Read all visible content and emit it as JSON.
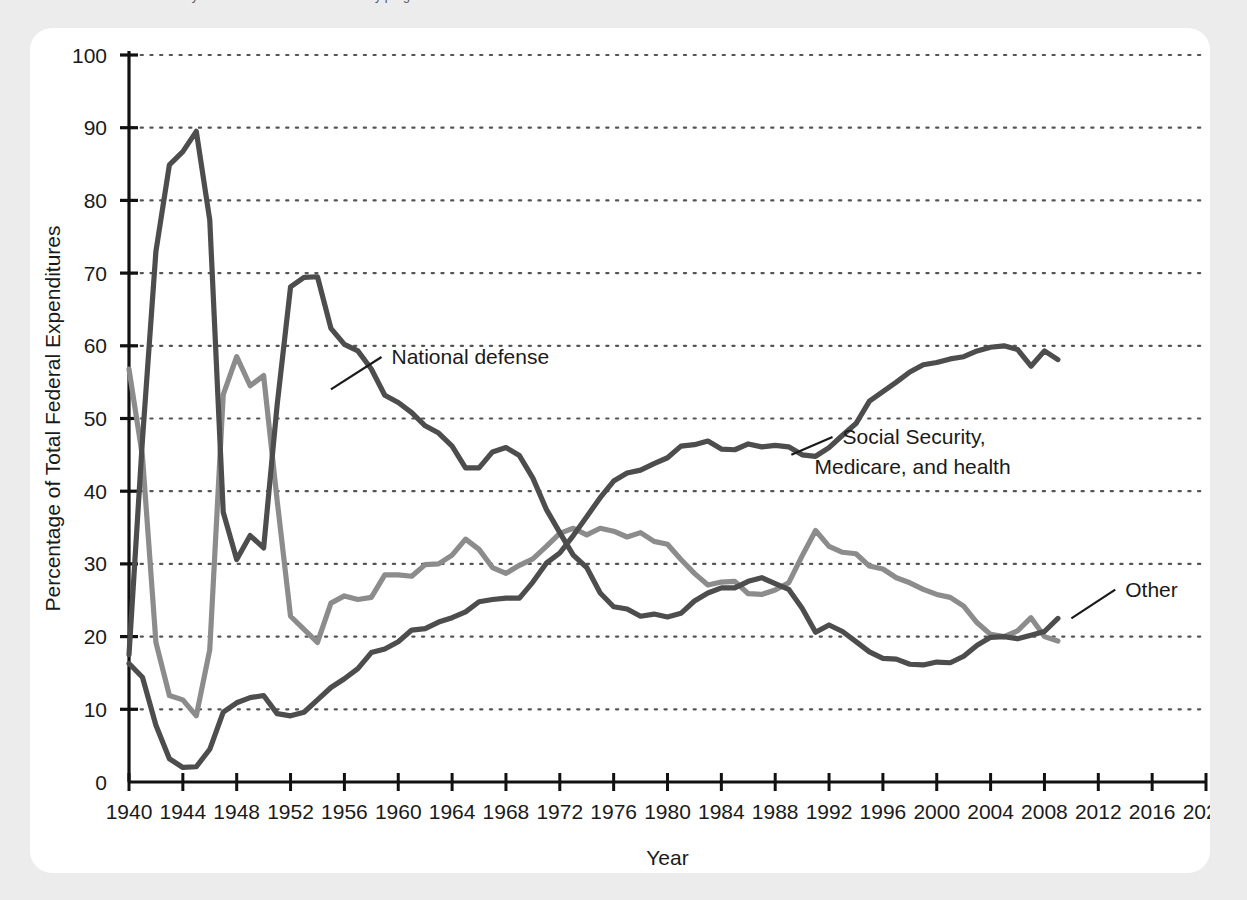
{
  "caption": {
    "text": "mes the mid-1950s. Social Security and other transfers to the elderly programs"
  },
  "chart_data": {
    "type": "line",
    "title": "",
    "xlabel": "Year",
    "ylabel": "Percentage of Total Federal Expenditures",
    "xlim": [
      1940,
      2020
    ],
    "ylim": [
      0,
      100
    ],
    "xticks": [
      1940,
      1944,
      1948,
      1952,
      1956,
      1960,
      1964,
      1968,
      1972,
      1976,
      1980,
      1984,
      1988,
      1992,
      1996,
      2000,
      2004,
      2008,
      2012,
      2016,
      2020
    ],
    "yticks": [
      0,
      10,
      20,
      30,
      40,
      50,
      60,
      70,
      80,
      90,
      100
    ],
    "grid": "horizontal-dotted",
    "legend": "inline-annotations",
    "colors": {
      "national_defense": "#4d4d4d",
      "social_security": "#4d4d4d",
      "other": "#8c8c8c",
      "grid": "#555555",
      "axis": "#111111",
      "background": "#ffffff",
      "page": "#ececec"
    },
    "annotations": [
      {
        "name": "national-defense",
        "label": "National defense",
        "label_x": 1959.5,
        "label_y": 57.5,
        "anchor_x": 1955.0,
        "anchor_y": 54.0
      },
      {
        "name": "social-security",
        "label": "Social Security,",
        "label2": "Medicare, and health",
        "label_x": 1993.0,
        "label_y": 46.5,
        "anchor_x": 1989.2,
        "anchor_y": 45.0
      },
      {
        "name": "other",
        "label": "Other",
        "label_x": 2014.0,
        "label_y": 25.5,
        "anchor_x": 2010.0,
        "anchor_y": 22.5
      }
    ],
    "series": [
      {
        "name": "National defense",
        "color": "#4d4d4d",
        "x": [
          1940,
          1941,
          1942,
          1943,
          1944,
          1945,
          1946,
          1947,
          1948,
          1949,
          1950,
          1951,
          1952,
          1953,
          1954,
          1955,
          1956,
          1957,
          1958,
          1959,
          1960,
          1961,
          1962,
          1963,
          1964,
          1965,
          1966,
          1967,
          1968,
          1969,
          1970,
          1971,
          1972,
          1973,
          1974,
          1975,
          1976,
          1977,
          1978,
          1979,
          1980,
          1981,
          1982,
          1983,
          1984,
          1985,
          1986,
          1987,
          1988,
          1989,
          1990,
          1991,
          1992,
          1993,
          1994,
          1995,
          1996,
          1997,
          1998,
          1999,
          2000,
          2001,
          2002,
          2003,
          2004,
          2005,
          2006,
          2007,
          2008,
          2009
        ],
        "values": [
          17.5,
          47.1,
          73.0,
          84.9,
          86.7,
          89.5,
          77.3,
          37.1,
          30.6,
          33.9,
          32.2,
          51.8,
          68.1,
          69.4,
          69.5,
          62.4,
          60.2,
          59.3,
          56.8,
          53.2,
          52.2,
          50.8,
          49.0,
          48.0,
          46.2,
          43.2,
          43.2,
          45.4,
          46.0,
          44.9,
          41.8,
          37.5,
          34.3,
          31.2,
          29.5,
          26.0,
          24.1,
          23.8,
          22.8,
          23.1,
          22.7,
          23.2,
          24.9,
          26.0,
          26.7,
          26.7,
          27.6,
          28.1,
          27.3,
          26.5,
          23.9,
          20.6,
          21.6,
          20.7,
          19.3,
          17.9,
          17.0,
          16.9,
          16.2,
          16.1,
          16.5,
          16.4,
          17.3,
          18.8,
          19.9,
          20.0,
          19.7,
          20.2,
          20.7,
          22.5
        ]
      },
      {
        "name": "Social Security, Medicare, and health",
        "color": "#4d4d4d",
        "x": [
          1940,
          1941,
          1942,
          1943,
          1944,
          1945,
          1946,
          1947,
          1948,
          1949,
          1950,
          1951,
          1952,
          1953,
          1954,
          1955,
          1956,
          1957,
          1958,
          1959,
          1960,
          1961,
          1962,
          1963,
          1964,
          1965,
          1966,
          1967,
          1968,
          1969,
          1970,
          1971,
          1972,
          1973,
          1974,
          1975,
          1976,
          1977,
          1978,
          1979,
          1980,
          1981,
          1982,
          1983,
          1984,
          1985,
          1986,
          1987,
          1988,
          1989,
          1990,
          1991,
          1992,
          1993,
          1994,
          1995,
          1996,
          1997,
          1998,
          1999,
          2000,
          2001,
          2002,
          2003,
          2004,
          2005,
          2006,
          2007,
          2008,
          2009
        ],
        "values": [
          16.3,
          14.4,
          7.8,
          3.2,
          2.0,
          2.1,
          4.5,
          9.6,
          10.9,
          11.6,
          11.9,
          9.4,
          9.1,
          9.6,
          11.3,
          13.0,
          14.2,
          15.6,
          17.8,
          18.3,
          19.3,
          20.9,
          21.1,
          22.0,
          22.6,
          23.4,
          24.8,
          25.1,
          25.3,
          25.3,
          27.5,
          30.1,
          31.5,
          33.9,
          36.5,
          39.1,
          41.4,
          42.5,
          42.9,
          43.8,
          44.6,
          46.2,
          46.4,
          46.9,
          45.8,
          45.7,
          46.5,
          46.1,
          46.3,
          46.1,
          45.0,
          44.8,
          46.0,
          47.7,
          49.3,
          52.4,
          53.7,
          55.0,
          56.4,
          57.4,
          57.7,
          58.2,
          58.5,
          59.3,
          59.8,
          60.0,
          59.5,
          57.2,
          59.3,
          58.1
        ]
      },
      {
        "name": "Other",
        "color": "#8c8c8c",
        "x": [
          1940,
          1941,
          1942,
          1943,
          1944,
          1945,
          1946,
          1947,
          1948,
          1949,
          1950,
          1951,
          1952,
          1953,
          1954,
          1955,
          1956,
          1957,
          1958,
          1959,
          1960,
          1961,
          1962,
          1963,
          1964,
          1965,
          1966,
          1967,
          1968,
          1969,
          1970,
          1971,
          1972,
          1973,
          1974,
          1975,
          1976,
          1977,
          1978,
          1979,
          1980,
          1981,
          1982,
          1983,
          1984,
          1985,
          1986,
          1987,
          1988,
          1989,
          1990,
          1991,
          1992,
          1993,
          1994,
          1995,
          1996,
          1997,
          1998,
          1999,
          2000,
          2001,
          2002,
          2003,
          2004,
          2005,
          2006,
          2007,
          2008,
          2009
        ],
        "values": [
          56.8,
          44.8,
          19.2,
          11.9,
          11.3,
          9.1,
          18.2,
          53.3,
          58.5,
          54.5,
          55.9,
          38.8,
          22.8,
          21.0,
          19.2,
          24.6,
          25.6,
          25.1,
          25.4,
          28.5,
          28.5,
          28.3,
          29.9,
          30.0,
          31.2,
          33.4,
          32.0,
          29.5,
          28.7,
          29.8,
          30.7,
          32.4,
          34.2,
          34.9,
          34.0,
          34.9,
          34.5,
          33.7,
          34.3,
          33.1,
          32.7,
          30.6,
          28.7,
          27.1,
          27.5,
          27.6,
          25.9,
          25.8,
          26.4,
          27.4,
          31.1,
          34.6,
          32.4,
          31.6,
          31.4,
          29.7,
          29.3,
          28.1,
          27.4,
          26.5,
          25.8,
          25.4,
          24.2,
          21.9,
          20.3,
          20.0,
          20.8,
          22.6,
          20.0,
          19.4
        ]
      }
    ]
  }
}
